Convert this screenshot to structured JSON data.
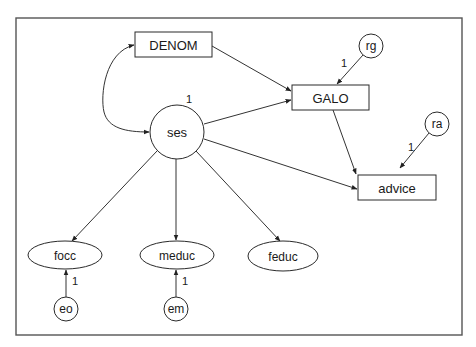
{
  "diagram": {
    "type": "path-diagram (structural equation model)",
    "frame": {
      "x": 16,
      "y": 18,
      "width": 446,
      "height": 317
    },
    "nodes": {
      "DENOM": {
        "label": "DENOM",
        "shape": "rect",
        "x": 135,
        "y": 32,
        "w": 77,
        "h": 25
      },
      "GALO": {
        "label": "GALO",
        "shape": "rect",
        "x": 292,
        "y": 85,
        "w": 77,
        "h": 25
      },
      "advice": {
        "label": "advice",
        "shape": "rect",
        "x": 358,
        "y": 175,
        "w": 78,
        "h": 25
      },
      "ses": {
        "label": "ses",
        "shape": "circle",
        "cx": 177,
        "cy": 132,
        "r": 27
      },
      "rg": {
        "label": "rg",
        "shape": "circle",
        "cx": 371,
        "cy": 46,
        "r": 12
      },
      "ra": {
        "label": "ra",
        "shape": "circle",
        "cx": 437,
        "cy": 124,
        "r": 12
      },
      "focc": {
        "label": "focc",
        "shape": "ellipse",
        "cx": 65,
        "cy": 255,
        "rx": 37,
        "ry": 14
      },
      "meduc": {
        "label": "meduc",
        "shape": "ellipse",
        "cx": 177,
        "cy": 255,
        "rx": 37,
        "ry": 14
      },
      "feduc": {
        "label": "feduc",
        "shape": "ellipse",
        "cx": 283,
        "cy": 256,
        "rx": 35,
        "ry": 15
      },
      "eo": {
        "label": "eo",
        "shape": "circle",
        "cx": 66,
        "cy": 309,
        "r": 12
      },
      "em": {
        "label": "em",
        "shape": "circle",
        "cx": 176,
        "cy": 309,
        "r": 12
      }
    },
    "edges": [
      {
        "from": "DENOM",
        "to": "GALO",
        "type": "directed"
      },
      {
        "from": "ses",
        "to": "GALO",
        "type": "directed"
      },
      {
        "from": "rg",
        "to": "GALO",
        "type": "directed",
        "label": "1"
      },
      {
        "from": "GALO",
        "to": "advice",
        "type": "directed"
      },
      {
        "from": "ses",
        "to": "advice",
        "type": "directed"
      },
      {
        "from": "ra",
        "to": "advice",
        "type": "directed",
        "label": "1"
      },
      {
        "from": "ses",
        "to": "focc",
        "type": "directed"
      },
      {
        "from": "ses",
        "to": "meduc",
        "type": "directed"
      },
      {
        "from": "ses",
        "to": "feduc",
        "type": "directed"
      },
      {
        "from": "eo",
        "to": "focc",
        "type": "directed",
        "label": "1"
      },
      {
        "from": "em",
        "to": "meduc",
        "type": "directed",
        "label": "1"
      },
      {
        "from": "DENOM",
        "to": "ses",
        "type": "bidirected-curve"
      }
    ],
    "annotations": {
      "ses_variance": "1",
      "rg_loading": "1",
      "ra_loading": "1",
      "eo_loading": "1",
      "em_loading": "1"
    },
    "colors": {
      "stroke": "#2a2a2a",
      "frame": "#555555",
      "background": "#ffffff"
    }
  }
}
